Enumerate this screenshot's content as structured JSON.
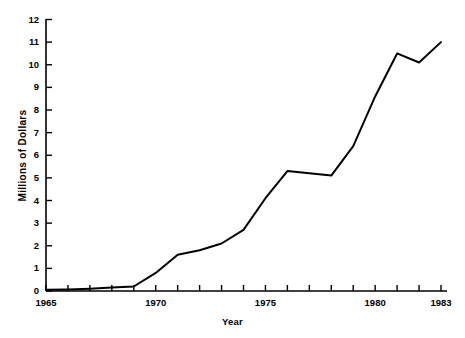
{
  "chart_data": {
    "type": "line",
    "title": "",
    "xlabel": "Year",
    "ylabel": "Millions of Dollars",
    "xlim": [
      1965,
      1983
    ],
    "ylim": [
      0,
      12
    ],
    "grid": false,
    "legend": null,
    "x_tick_labels": [
      "1965",
      "1970",
      "1975",
      "1980",
      "1983"
    ],
    "x_tick_values": [
      1965,
      1970,
      1975,
      1980,
      1983
    ],
    "x_minor_ticks": [
      1966,
      1967,
      1968,
      1969,
      1971,
      1972,
      1973,
      1974,
      1976,
      1977,
      1978,
      1979,
      1981,
      1982
    ],
    "y_tick_labels": [
      "0",
      "1",
      "2",
      "3",
      "4",
      "5",
      "6",
      "7",
      "8",
      "9",
      "10",
      "11",
      "12"
    ],
    "y_tick_values": [
      0,
      1,
      2,
      3,
      4,
      5,
      6,
      7,
      8,
      9,
      10,
      11,
      12
    ],
    "line_color": "#000000",
    "line_width": 2,
    "x": [
      1965,
      1966,
      1967,
      1968,
      1969,
      1970,
      1971,
      1972,
      1973,
      1974,
      1975,
      1976,
      1977,
      1978,
      1979,
      1980,
      1981,
      1982,
      1983
    ],
    "values": [
      0.05,
      0.07,
      0.1,
      0.15,
      0.2,
      0.8,
      1.6,
      1.8,
      2.1,
      2.7,
      4.1,
      5.3,
      5.2,
      5.1,
      6.4,
      8.6,
      10.5,
      10.1,
      11.0
    ]
  },
  "axis": {
    "y_axis_name": "y-axis",
    "x_axis_name": "x-axis"
  }
}
